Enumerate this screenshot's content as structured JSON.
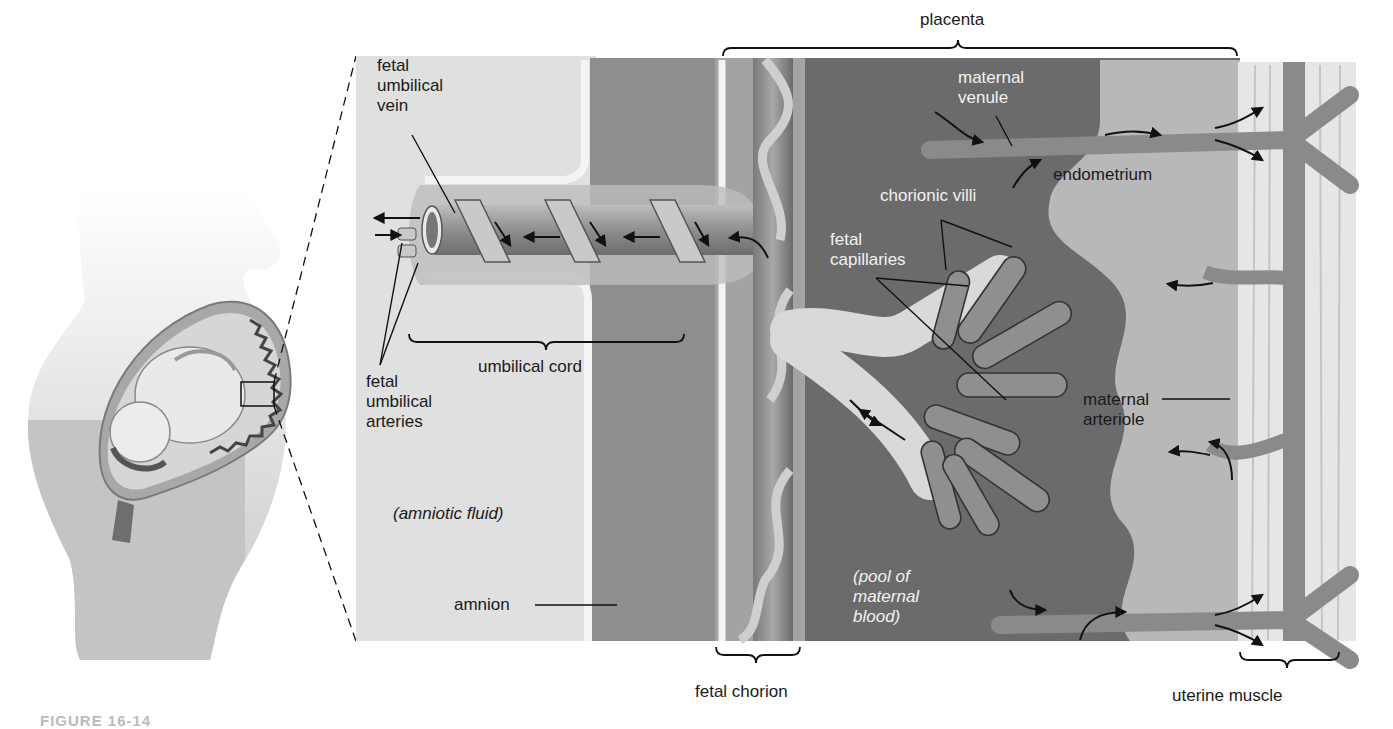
{
  "figure": {
    "caption_fragment": "FIGURE 16-14",
    "colors": {
      "background": "#ffffff",
      "amniotic_fluid": "#e2e2e2",
      "amnion_band": "#8e8e8e",
      "maternal_blood_pool": "#6b6b6b",
      "endometrium": "#b8b8b8",
      "uterine_muscle": "#e6e6e6",
      "vessel": "#9a9a9a",
      "vessel_dark": "#555555",
      "villus_border": "#d9d9d9",
      "body_silhouette": "#c4c4c4",
      "line": "#111111",
      "label_dark": "#1a1a1a",
      "label_light": "#f2f2f2"
    }
  },
  "labels": {
    "placenta": "placenta",
    "fetal_umbilical_vein": "fetal\numbilical\nvein",
    "maternal_venule": "maternal\nvenule",
    "endometrium": "endometrium",
    "chorionic_villi": "chorionic villi",
    "fetal_capillaries": "fetal\ncapillaries",
    "fetal_umbilical_arteries": "fetal\numbilical\narteries",
    "umbilical_cord": "umbilical cord",
    "maternal_arteriole": "maternal\narteriole",
    "amniotic_fluid": "(amniotic fluid)",
    "amnion": "amnion",
    "pool_of_maternal_blood": "(pool of\nmaternal\nblood)",
    "fetal_chorion": "fetal chorion",
    "uterine_muscle": "uterine muscle"
  },
  "label_positions": {
    "placenta": {
      "x": 920,
      "y": 10
    },
    "fetal_umbilical_vein": {
      "x": 377,
      "y": 56
    },
    "maternal_venule": {
      "x": 958,
      "y": 68
    },
    "endometrium": {
      "x": 1053,
      "y": 165
    },
    "chorionic_villi": {
      "x": 880,
      "y": 186
    },
    "fetal_capillaries": {
      "x": 830,
      "y": 230
    },
    "fetal_umbilical_arteries": {
      "x": 366,
      "y": 372
    },
    "umbilical_cord": {
      "x": 478,
      "y": 357
    },
    "maternal_arteriole": {
      "x": 1083,
      "y": 390
    },
    "amniotic_fluid": {
      "x": 393,
      "y": 504
    },
    "amnion": {
      "x": 454,
      "y": 595
    },
    "pool_of_maternal_blood": {
      "x": 853,
      "y": 567
    },
    "fetal_chorion": {
      "x": 695,
      "y": 682
    },
    "uterine_muscle": {
      "x": 1172,
      "y": 686
    }
  },
  "leader_lines": [
    {
      "name": "fetal-umbilical-vein-leader",
      "x1": 412,
      "y1": 135,
      "x2": 455,
      "y2": 213
    },
    {
      "name": "maternal-venule-leader",
      "x1": 996,
      "y1": 116,
      "x2": 1012,
      "y2": 146
    },
    {
      "name": "chorionic-villi-leader-1",
      "x1": 941,
      "y1": 220,
      "x2": 946,
      "y2": 270
    },
    {
      "name": "chorionic-villi-leader-2",
      "x1": 941,
      "y1": 220,
      "x2": 1012,
      "y2": 247
    },
    {
      "name": "fetal-capillaries-leader-1",
      "x1": 876,
      "y1": 278,
      "x2": 968,
      "y2": 286
    },
    {
      "name": "fetal-capillaries-leader-2",
      "x1": 876,
      "y1": 278,
      "x2": 1006,
      "y2": 400
    },
    {
      "name": "fetal-umbilical-arteries-leader-1",
      "x1": 380,
      "y1": 365,
      "x2": 402,
      "y2": 243
    },
    {
      "name": "fetal-umbilical-arteries-leader-2",
      "x1": 380,
      "y1": 365,
      "x2": 418,
      "y2": 263
    },
    {
      "name": "maternal-arteriole-leader",
      "x1": 1162,
      "y1": 399,
      "x2": 1230,
      "y2": 399
    },
    {
      "name": "amnion-leader",
      "x1": 535,
      "y1": 605,
      "x2": 617,
      "y2": 605
    }
  ],
  "braces": [
    {
      "name": "placenta-brace",
      "x1": 723,
      "x2": 1237,
      "y": 48,
      "direction": "down",
      "tip_x": 958
    },
    {
      "name": "umbilical-cord-brace",
      "x1": 409,
      "x2": 684,
      "y": 342,
      "direction": "up",
      "tip_x": 546
    },
    {
      "name": "fetal-chorion-brace",
      "x1": 716,
      "x2": 800,
      "y": 655,
      "direction": "up",
      "tip_x": 756
    },
    {
      "name": "uterine-muscle-brace",
      "x1": 1240,
      "x2": 1339,
      "y": 660,
      "direction": "up",
      "tip_x": 1287
    }
  ],
  "zoom_inset": {
    "source_box": {
      "x": 241,
      "y": 382,
      "w": 33,
      "h": 24
    },
    "detail_panel": {
      "x": 356,
      "y": 56,
      "w": 1000,
      "h": 585
    }
  }
}
